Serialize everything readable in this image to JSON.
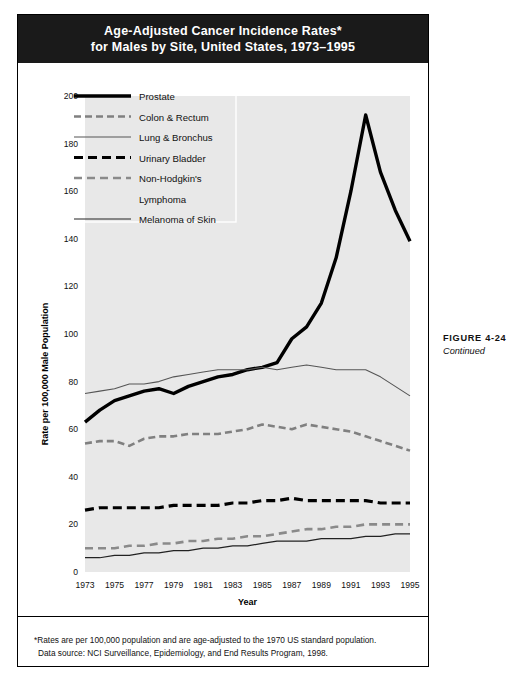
{
  "figure": {
    "title_line1": "Age-Adjusted Cancer Incidence Rates*",
    "title_line2": "for Males by Site, United States, 1973–1995",
    "caption_main": "FIGURE 4-24",
    "caption_sub": "Continued",
    "footnote1": "*Rates are per 100,000 population and are age-adjusted to the 1970 US standard population.",
    "footnote2": "Data source: NCI Surveillance, Epidemiology, and End Results Program, 1998."
  },
  "colors": {
    "banner_bg": "#1a1a1a",
    "banner_text": "#ffffff",
    "plot_bg": "#e8e8e8",
    "prostate": "#000000",
    "colon_rectum": "#808080",
    "lung_bronchus": "#555555",
    "urinary_bladder": "#000000",
    "non_hodgkin": "#8a8a8a",
    "melanoma": "#222222"
  },
  "chart_data": {
    "type": "line",
    "title": "Age-Adjusted Cancer Incidence Rates* for Males by Site, United States, 1973–1995",
    "xlabel": "Year",
    "ylabel": "Rate per 100,000 Male Population",
    "xlim": [
      1973,
      1995
    ],
    "ylim": [
      0,
      200
    ],
    "yticks": [
      0,
      20,
      40,
      60,
      80,
      100,
      120,
      140,
      160,
      180,
      200
    ],
    "xticks": [
      1973,
      1975,
      1977,
      1979,
      1981,
      1983,
      1985,
      1987,
      1989,
      1991,
      1993,
      1995
    ],
    "grid": false,
    "legend_position": "upper-left",
    "x": [
      1973,
      1974,
      1975,
      1976,
      1977,
      1978,
      1979,
      1980,
      1981,
      1982,
      1983,
      1984,
      1985,
      1986,
      1987,
      1988,
      1989,
      1990,
      1991,
      1992,
      1993,
      1994,
      1995
    ],
    "series": [
      {
        "name": "Prostate",
        "style": "solid-thick",
        "color": "#000000",
        "values": [
          63,
          68,
          72,
          74,
          76,
          77,
          75,
          78,
          80,
          82,
          83,
          85,
          86,
          88,
          98,
          103,
          113,
          132,
          160,
          192,
          168,
          152,
          139
        ]
      },
      {
        "name": "Colon & Rectum",
        "style": "dashed-medium",
        "color": "#808080",
        "values": [
          54,
          55,
          55,
          53,
          56,
          57,
          57,
          58,
          58,
          58,
          59,
          60,
          62,
          61,
          60,
          62,
          61,
          60,
          59,
          57,
          55,
          53,
          51
        ]
      },
      {
        "name": "Lung & Bronchus",
        "style": "solid-thin",
        "color": "#555555",
        "values": [
          75,
          76,
          77,
          79,
          79,
          80,
          82,
          83,
          84,
          85,
          85,
          85,
          86,
          85,
          86,
          87,
          86,
          85,
          85,
          85,
          82,
          78,
          74
        ]
      },
      {
        "name": "Urinary Bladder",
        "style": "dashed-thick",
        "color": "#000000",
        "values": [
          26,
          27,
          27,
          27,
          27,
          27,
          28,
          28,
          28,
          28,
          29,
          29,
          30,
          30,
          31,
          30,
          30,
          30,
          30,
          30,
          29,
          29,
          29
        ]
      },
      {
        "name": "Non-Hodgkin's Lymphoma",
        "style": "dashed-gray",
        "color": "#8a8a8a",
        "values": [
          10,
          10,
          10,
          11,
          11,
          12,
          12,
          13,
          13,
          14,
          14,
          15,
          15,
          16,
          17,
          18,
          18,
          19,
          19,
          20,
          20,
          20,
          20
        ]
      },
      {
        "name": "Melanoma of Skin",
        "style": "solid-thin-dark",
        "color": "#222222",
        "values": [
          6,
          6,
          7,
          7,
          8,
          8,
          9,
          9,
          10,
          10,
          11,
          11,
          12,
          13,
          13,
          13,
          14,
          14,
          14,
          15,
          15,
          16,
          16
        ]
      }
    ]
  },
  "legend": {
    "items": [
      {
        "label": "Prostate",
        "key": "prostate"
      },
      {
        "label": "Colon & Rectum",
        "key": "colon_rectum"
      },
      {
        "label": "Lung & Bronchus",
        "key": "lung_bronchus"
      },
      {
        "label": "Urinary Bladder",
        "key": "urinary_bladder"
      },
      {
        "label": "Non-Hodgkin's",
        "key": "non_hodgkin"
      },
      {
        "label": "Lymphoma",
        "key": "non_hodgkin_cont"
      },
      {
        "label": "Melanoma of Skin",
        "key": "melanoma"
      }
    ]
  }
}
